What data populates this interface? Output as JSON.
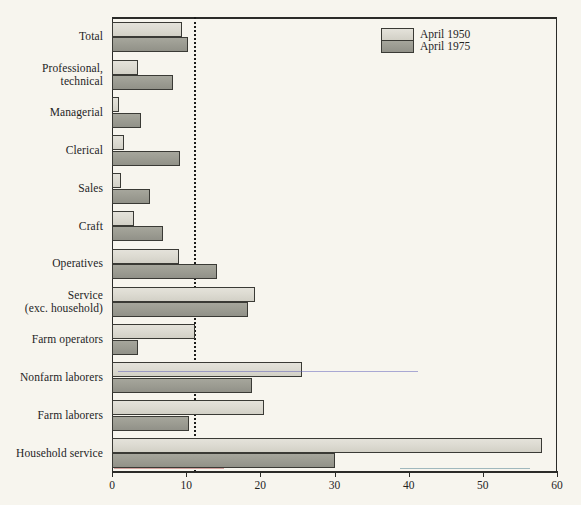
{
  "chart_data": {
    "type": "bar",
    "orientation": "horizontal",
    "title": "",
    "xlabel": "",
    "ylabel": "",
    "xlim": [
      0,
      60
    ],
    "xticks": [
      0,
      10,
      20,
      30,
      40,
      50,
      60
    ],
    "xtick_labels": [
      "0",
      "10",
      "20",
      "30",
      "40",
      "50",
      "60"
    ],
    "grid": false,
    "reference_line": {
      "value": 11,
      "style": "dotted",
      "color": "#1c1c1a"
    },
    "legend": {
      "position": "top-right",
      "entries": [
        {
          "name": "April 1950",
          "color": "#dcdad1"
        },
        {
          "name": "April 1975",
          "color": "#9b9b91"
        }
      ]
    },
    "categories": [
      "Total",
      "Professional, technical",
      "Managerial",
      "Clerical",
      "Sales",
      "Craft",
      "Operatives",
      "Service (exc. household)",
      "Farm operators",
      "Nonfarm laborers",
      "Farm laborers",
      "Household service"
    ],
    "category_label_lines": [
      [
        "Total"
      ],
      [
        "Professional,",
        "technical"
      ],
      [
        "Managerial"
      ],
      [
        "Clerical"
      ],
      [
        "Sales"
      ],
      [
        "Craft"
      ],
      [
        "Operatives"
      ],
      [
        "Service",
        "(exc. household)"
      ],
      [
        "Farm operators"
      ],
      [
        "Nonfarm laborers"
      ],
      [
        "Farm laborers"
      ],
      [
        "Household service"
      ]
    ],
    "series": [
      {
        "name": "April 1950",
        "values": [
          9.4,
          3.5,
          1.0,
          1.6,
          1.2,
          3.0,
          9.0,
          19.3,
          11.2,
          25.6,
          20.5,
          58.0
        ]
      },
      {
        "name": "April 1975",
        "values": [
          10.2,
          8.2,
          3.9,
          9.2,
          5.1,
          6.9,
          14.2,
          18.3,
          3.5,
          18.9,
          10.4,
          30.1
        ]
      }
    ]
  }
}
